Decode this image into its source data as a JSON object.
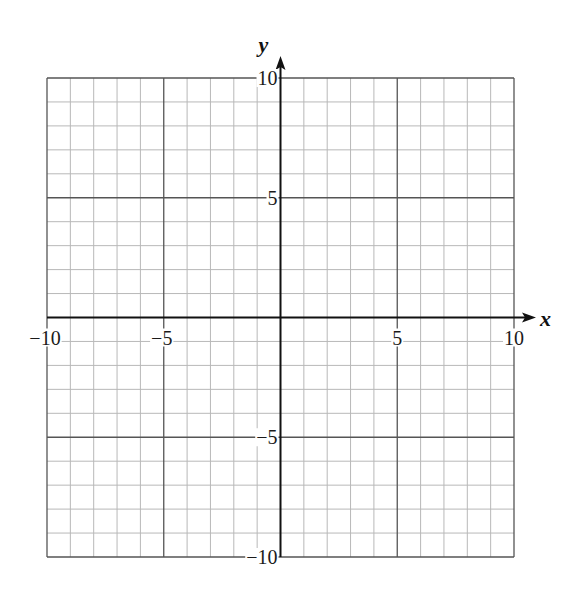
{
  "chart_data": {
    "type": "grid",
    "title": "",
    "xlabel": "x",
    "ylabel": "y",
    "xlim": [
      -10,
      10
    ],
    "ylim": [
      -10,
      10
    ],
    "grid": true,
    "minor_step": 1,
    "major_step": 5,
    "x_tick_labels": [
      "−10",
      "−5",
      "5",
      "10"
    ],
    "x_tick_values": [
      -10,
      -5,
      5,
      10
    ],
    "y_tick_labels": [
      "10",
      "5",
      "−5",
      "−10"
    ],
    "y_tick_values": [
      10,
      5,
      -5,
      -10
    ],
    "series": []
  },
  "colors": {
    "minor_grid": "#b8b8b8",
    "major_grid": "#555555",
    "axis": "#111111",
    "background": "#ffffff"
  },
  "layout": {
    "left": 47,
    "right": 514,
    "top": 78,
    "bottom": 557
  }
}
